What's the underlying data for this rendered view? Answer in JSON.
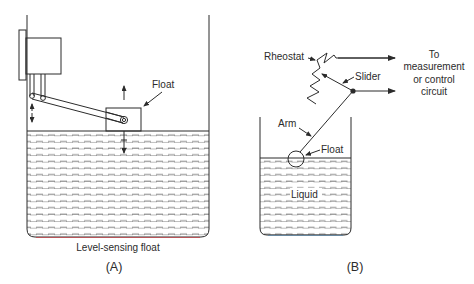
{
  "figure": {
    "panel_a": {
      "caption": "Level-sensing float",
      "panel_label": "(A)",
      "float_label": "Float",
      "components": [
        "tank",
        "housing-box",
        "pivot-arm",
        "float-box",
        "liquid",
        "up-arrow",
        "vertical-motion-arrows"
      ]
    },
    "panel_b": {
      "panel_label": "(B)",
      "labels": {
        "rheostat": "Rheostat",
        "slider": "Slider",
        "arm": "Arm",
        "float": "Float",
        "liquid": "Liquid",
        "output_line1": "To",
        "output_line2": "measurement",
        "output_line3": "or control",
        "output_line4": "circuit"
      },
      "components": [
        "tank",
        "ball-float",
        "arm",
        "pivot-junction",
        "slider",
        "rheostat",
        "output-leads",
        "liquid"
      ]
    },
    "colors": {
      "line": "#2b2b2b",
      "liquid_dash": "#555555",
      "tank_bottom_accent_a": "#c0454a",
      "tank_bottom_accent_b": "#4a7fa8",
      "background": "#ffffff"
    }
  }
}
